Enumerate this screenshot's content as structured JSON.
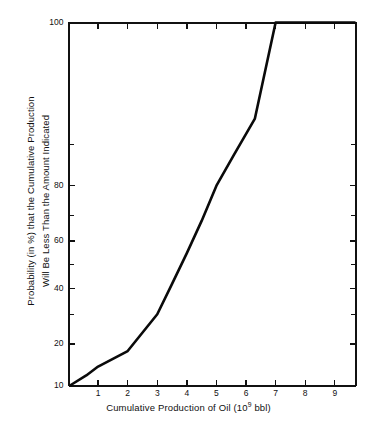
{
  "chart_data": {
    "type": "line",
    "title": "",
    "subtitle": "",
    "xlabel_text": "Cumulative Production of Oil (10",
    "xlabel_exponent": "9",
    "xlabel_suffix": " bbl)",
    "xlabel": "Cumulative Production of Oil (10^9 bbl)",
    "ylabel": "Probability (in %) that the Cumulative Production Will Be Less Than the Amount Indicated",
    "ylabel_line1": "Probability (in %) that the Cumulative Production",
    "ylabel_line2": "Will Be Less Than the Amount Indicated",
    "grid": false,
    "legend": false,
    "legend_position": "none",
    "xlim": [
      0,
      9.7
    ],
    "ylim": [
      10,
      100
    ],
    "y_scale": "probability",
    "x_ticks": [
      1,
      2,
      3,
      4,
      5,
      6,
      7,
      8,
      9
    ],
    "x_tick_labels": [
      "1",
      "2",
      "3",
      "4",
      "5",
      "6",
      "7",
      "8",
      "9"
    ],
    "y_ticks_major": [
      10,
      20,
      40,
      60,
      80,
      100
    ],
    "y_tick_labels": [
      "10",
      "20",
      "40",
      "60",
      "80",
      "100"
    ],
    "y_ticks_minor": [
      30,
      50,
      70,
      90
    ],
    "series": [
      {
        "name": "Cumulative probability of oil production",
        "x": [
          0.05,
          0.6,
          1.0,
          2.0,
          3.0,
          3.5,
          4.0,
          4.5,
          5.0,
          5.6,
          6.3,
          7.0,
          8.0,
          9.0,
          9.7
        ],
        "values": [
          10,
          12,
          14,
          18,
          30,
          42,
          55,
          68,
          80,
          88,
          94,
          100,
          100,
          100,
          100
        ]
      }
    ],
    "annotations": [],
    "line_color": "#0a0a0a",
    "background_color": "#ffffff",
    "axis_color": "#111111"
  },
  "figure": {
    "width": 377,
    "height": 438
  }
}
